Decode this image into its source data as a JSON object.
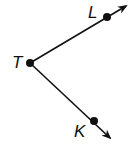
{
  "diagram": {
    "type": "angle",
    "vertex": {
      "label": "T",
      "x": 30,
      "y": 63
    },
    "rays": [
      {
        "name": "ray-TL",
        "through": {
          "label": "L",
          "x": 107,
          "y": 17
        },
        "arrow_tip": {
          "x": 126,
          "y": 6
        }
      },
      {
        "name": "ray-TK",
        "through": {
          "label": "K",
          "x": 94,
          "y": 121
        },
        "arrow_tip": {
          "x": 110,
          "y": 138
        }
      }
    ],
    "labels": {
      "T": "T",
      "L": "L",
      "K": "K"
    },
    "colors": {
      "stroke": "#111111",
      "background": "#ffffff"
    }
  }
}
